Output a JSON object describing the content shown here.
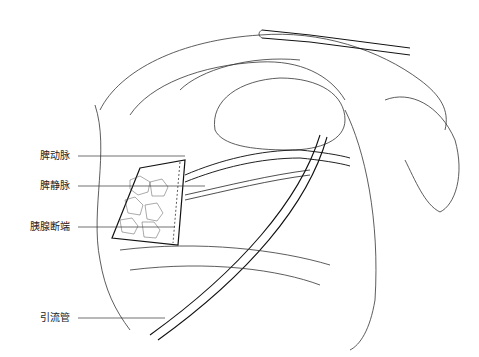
{
  "labels": [
    {
      "text": "脾动脉",
      "x": 40,
      "y": 150,
      "line_y": 156,
      "line_end": 185
    },
    {
      "text": "脾静脉",
      "x": 40,
      "y": 180,
      "line_y": 186,
      "line_end": 205
    },
    {
      "text": "胰腺断端",
      "x": 30,
      "y": 221,
      "line_y": 227,
      "line_end": 175
    },
    {
      "text": "引流管",
      "x": 40,
      "y": 312,
      "line_y": 318,
      "line_end": 165
    }
  ]
}
